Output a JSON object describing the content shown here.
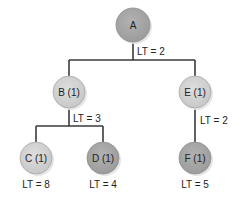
{
  "diagram": {
    "type": "tree",
    "colors": {
      "line": "#3a3a3a",
      "node_dark": "#a8a8a8",
      "node_light": "#d4d4d4",
      "node_stroke": "#9a9a9a",
      "shadow": "#e4e4e4"
    },
    "nodes": [
      {
        "id": "A",
        "label": "A",
        "lt": "LT = 2",
        "shade": "dark"
      },
      {
        "id": "B",
        "label": "B (1)",
        "lt": "LT = 3",
        "shade": "light"
      },
      {
        "id": "E",
        "label": "E (1)",
        "lt": "LT = 2",
        "shade": "light"
      },
      {
        "id": "C",
        "label": "C (1)",
        "lt": "LT = 8",
        "shade": "light"
      },
      {
        "id": "D",
        "label": "D (1)",
        "lt": "LT = 4",
        "shade": "dark"
      },
      {
        "id": "F",
        "label": "F (1)",
        "lt": "LT = 5",
        "shade": "dark"
      }
    ],
    "edges": [
      [
        "A",
        "B"
      ],
      [
        "A",
        "E"
      ],
      [
        "B",
        "C"
      ],
      [
        "B",
        "D"
      ],
      [
        "E",
        "F"
      ]
    ]
  }
}
